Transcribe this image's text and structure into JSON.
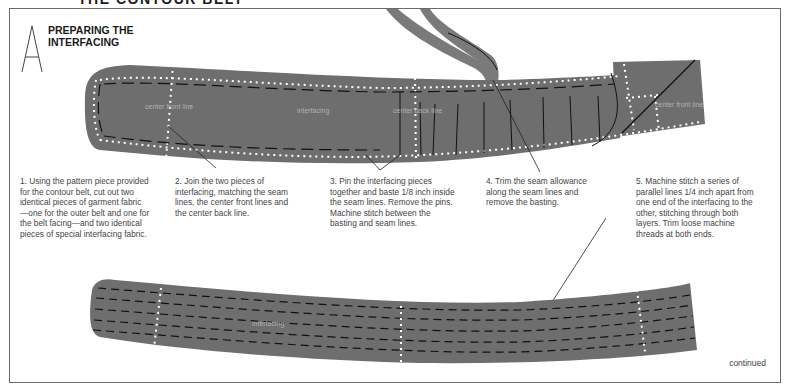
{
  "page": {
    "title": "THE CONTOUR BELT",
    "section_letter": "A",
    "section_title_line1": "PREPARING THE",
    "section_title_line2": "INTERFACING",
    "footer": "continued"
  },
  "colors": {
    "fabric": "#6e6e6e",
    "stitch_dots": "#ffffff",
    "basting_dashes": "#111111",
    "frame": "#6a6a6a"
  },
  "top_belt_labels": {
    "center_front_left": "center front line",
    "interfacing": "interfacing",
    "center_back": "center back line",
    "center_front_right": "center front line"
  },
  "bottom_belt_labels": {
    "interfacing": "interfacing"
  },
  "steps": [
    {
      "number": "1",
      "text": "1. Using the pattern piece provided for the contour belt, cut out two identical pieces of garment fabric —one for the outer belt and one for the belt facing—and two identical pieces of special interfacing fabric."
    },
    {
      "number": "2",
      "text": "2. Join the two pieces of interfacing, matching the seam lines, the center front lines and the center back line."
    },
    {
      "number": "3",
      "text": "3. Pin the interfacing pieces together and baste 1/8 inch inside the seam lines. Remove the pins. Machine stitch between the basting and seam lines."
    },
    {
      "number": "4",
      "text": "4. Trim the seam allowance along the seam lines and remove the basting."
    },
    {
      "number": "5",
      "text": "5. Machine stitch a series of parallel lines 1/4 inch apart from one end of the interfacing to the other, stitching through both layers. Trim loose machine threads at both ends."
    }
  ]
}
